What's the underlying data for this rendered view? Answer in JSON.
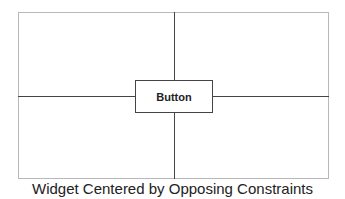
{
  "diagram": {
    "button_label": "Button",
    "caption": "Widget Centered by Opposing Constraints",
    "colors": {
      "frame": "#b8b8b8",
      "constraint": "#444444",
      "text": "#222222"
    }
  }
}
